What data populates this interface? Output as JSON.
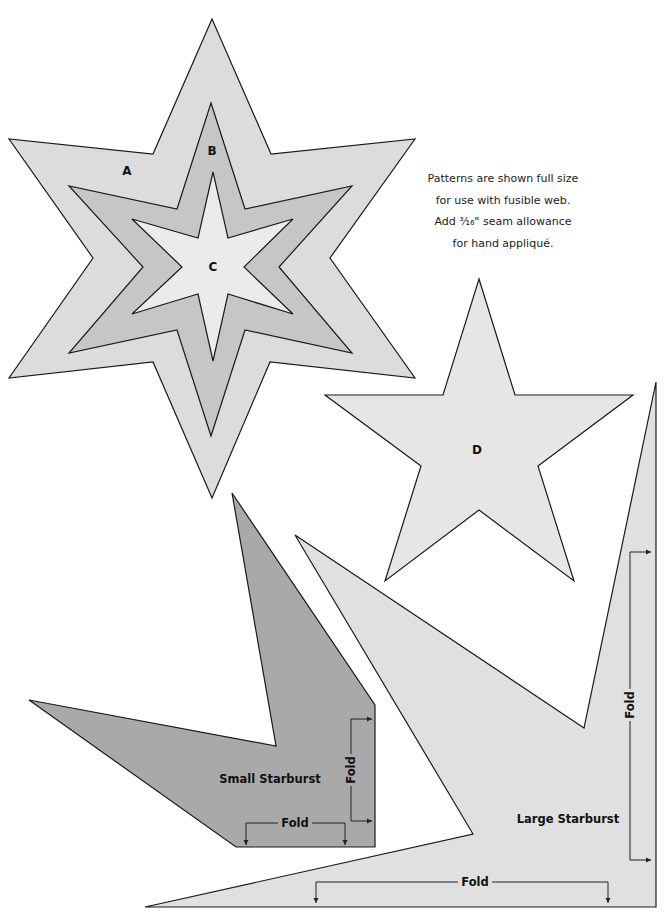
{
  "note": {
    "lines": [
      "Patterns are shown full size",
      "for use with fusible web.",
      "Add ³⁄₁₆\" seam allowance",
      "for hand appliqué."
    ]
  },
  "colors": {
    "outline": "#1a1a1a",
    "star_a": "#dcdcdc",
    "star_b": "#c6c6c6",
    "star_c": "#ebebeb",
    "star_d": "#e6e6e6",
    "small_starburst": "#a9a9a9",
    "large_starburst": "#e0e0e0"
  },
  "shapes": [
    {
      "id": "star-a",
      "label": "A",
      "fill_key": "star_a",
      "points": [
        [
          212,
          19
        ],
        [
          271,
          154
        ],
        [
          415,
          139
        ],
        [
          330,
          258
        ],
        [
          415,
          378
        ],
        [
          270,
          362
        ],
        [
          212,
          498
        ],
        [
          153,
          362
        ],
        [
          9,
          378
        ],
        [
          93,
          258
        ],
        [
          9,
          139
        ],
        [
          153,
          154
        ]
      ],
      "label_pos": [
        127,
        171
      ]
    },
    {
      "id": "star-b",
      "label": "B",
      "fill_key": "star_b",
      "points": [
        [
          211,
          103
        ],
        [
          245,
          209
        ],
        [
          352,
          186
        ],
        [
          279,
          267
        ],
        [
          352,
          353
        ],
        [
          245,
          330
        ],
        [
          211,
          436
        ],
        [
          177,
          330
        ],
        [
          69,
          353
        ],
        [
          143,
          267
        ],
        [
          69,
          186
        ],
        [
          177,
          209
        ]
      ],
      "label_pos": [
        212,
        151
      ]
    },
    {
      "id": "star-c",
      "label": "C",
      "fill_key": "star_c",
      "points": [
        [
          213,
          172
        ],
        [
          228,
          238
        ],
        [
          293,
          219
        ],
        [
          244,
          267
        ],
        [
          293,
          314
        ],
        [
          228,
          294
        ],
        [
          213,
          361
        ],
        [
          198,
          294
        ],
        [
          132,
          314
        ],
        [
          182,
          267
        ],
        [
          132,
          219
        ],
        [
          198,
          238
        ]
      ],
      "label_pos": [
        213,
        267
      ]
    },
    {
      "id": "star-d",
      "label": "D",
      "fill_key": "star_d",
      "points": [
        [
          479,
          279
        ],
        [
          515,
          395
        ],
        [
          633,
          395
        ],
        [
          538,
          466
        ],
        [
          574,
          581
        ],
        [
          479,
          510
        ],
        [
          385,
          581
        ],
        [
          421,
          466
        ],
        [
          325,
          395
        ],
        [
          443,
          395
        ]
      ],
      "label_pos": [
        477,
        450
      ]
    },
    {
      "id": "large-starburst",
      "label": "Large Starburst",
      "fill_key": "large_starburst",
      "points": [
        [
          656,
          382
        ],
        [
          656,
          907
        ],
        [
          145,
          907
        ],
        [
          473,
          834
        ],
        [
          295,
          535
        ],
        [
          584,
          728
        ]
      ],
      "label_pos": [
        568,
        819
      ]
    },
    {
      "id": "small-starburst",
      "label": "Small Starburst",
      "fill_key": "small_starburst",
      "points": [
        [
          232,
          493
        ],
        [
          375,
          705
        ],
        [
          375,
          847
        ],
        [
          236,
          847
        ],
        [
          29,
          700
        ],
        [
          276,
          746
        ]
      ],
      "label_pos": [
        270,
        779
      ]
    }
  ],
  "folds": [
    {
      "id": "small-fold-vertical",
      "label": "Fold",
      "orientation": "vertical",
      "line": {
        "x": 351,
        "y1": 719,
        "y2": 821,
        "tip": 372
      },
      "label_pos": [
        351,
        770
      ]
    },
    {
      "id": "small-fold-horizontal",
      "label": "Fold",
      "orientation": "horizontal",
      "line": {
        "y": 823,
        "x1": 246,
        "x2": 345,
        "tip": 845
      },
      "label_pos": [
        295,
        823
      ]
    },
    {
      "id": "large-fold-vertical",
      "label": "Fold",
      "orientation": "vertical",
      "line": {
        "x": 630,
        "y1": 552,
        "y2": 860,
        "tip": 651
      },
      "label_pos": [
        630,
        705
      ]
    },
    {
      "id": "large-fold-horizontal",
      "label": "Fold",
      "orientation": "horizontal",
      "line": {
        "y": 882,
        "x1": 316,
        "x2": 608,
        "tip": 903
      },
      "label_pos": [
        475,
        882
      ]
    }
  ]
}
